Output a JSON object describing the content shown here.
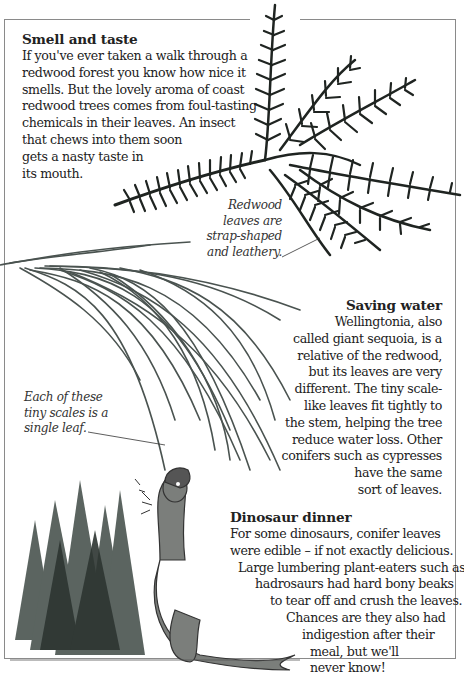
{
  "sections": {
    "smell_and_taste": {
      "title": "Smell and taste",
      "lines": [
        "If you've ever taken a walk through a",
        "redwood forest you know how nice it",
        "smells. But the lovely aroma of coast",
        "redwood trees comes from foul-tasting",
        "chemicals in their leaves. An insect",
        "that chews into them soon",
        "gets a nasty taste in",
        "its mouth."
      ]
    },
    "saving_water": {
      "title": "Saving water",
      "lines": [
        "Wellingtonia, also",
        "called giant sequoia, is a",
        "relative of the redwood,",
        "but its leaves are very",
        "different. The tiny scale-",
        "like leaves fit tightly to",
        "the stem, helping the tree",
        "reduce water loss. Other",
        "conifers such as cypresses",
        "have the same",
        "sort of leaves."
      ]
    },
    "dinosaur_dinner": {
      "title": "Dinosaur dinner",
      "lines": [
        "For some dinosaurs, conifer leaves",
        "were edible – if not exactly delicious.",
        "Large lumbering plant-eaters such as",
        "hadrosaurs had hard bony beaks",
        "to tear off and crush the leaves.",
        "Chances are  they also had",
        "indigestion after their",
        "meal, but we'll",
        "never know!"
      ]
    }
  },
  "captions": {
    "redwood": [
      "Redwood",
      "leaves are",
      "strap-shaped",
      "and leathery."
    ],
    "sequoia": [
      "Each of these",
      "tiny scales is a",
      "single leaf."
    ]
  },
  "illustrations": {
    "redwood_sprig": "redwood-sprig-photo",
    "sequoia_sprig": "giant-sequoia-sprig-photo",
    "dinosaur_scene": "hadrosaur-eating-conifers-painting"
  },
  "colors": {
    "redwood": "#1f2421",
    "sequoia": "#4a5350",
    "trees": "#3f4a45",
    "dino": "#6c6f6c",
    "frame": "#8a8a8a"
  }
}
